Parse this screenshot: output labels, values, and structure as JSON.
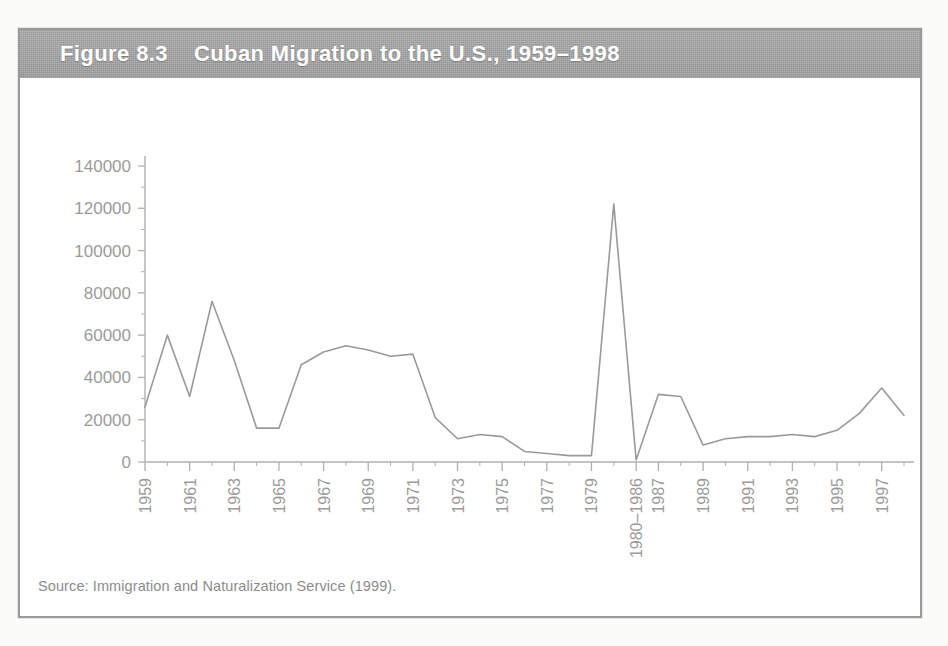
{
  "figure": {
    "number_label": "Figure 8.3",
    "title": "Cuban Migration to the U.S., 1959–1998",
    "source_note": "Source: Immigration and Naturalization Service (1999).",
    "banner_color": "#a3a3a3",
    "banner_text_color": "#ffffff",
    "line_color": "#9a9a9a",
    "axis_color": "#b0b0b0",
    "tick_label_color": "#9b9b9b",
    "frame_color": "#9a9a9a"
  },
  "chart_data": {
    "type": "line",
    "title": "Cuban Migration to the U.S., 1959–1998",
    "xlabel": "",
    "ylabel": "",
    "ylim": [
      0,
      140000
    ],
    "ytick_labels": [
      "0",
      "20000",
      "40000",
      "60000",
      "80000",
      "100000",
      "120000",
      "140000"
    ],
    "ytick_values": [
      0,
      20000,
      40000,
      60000,
      80000,
      100000,
      120000,
      140000
    ],
    "grid": false,
    "legend": "none",
    "xtick_labels_major": [
      "1959",
      "1961",
      "1963",
      "1965",
      "1967",
      "1969",
      "1971",
      "1973",
      "1975",
      "1977",
      "1979",
      "1980–1986",
      "1987",
      "1989",
      "1991",
      "1993",
      "1995",
      "1997"
    ],
    "categories": [
      "1959",
      "1960",
      "1961",
      "1962",
      "1963",
      "1964",
      "1965",
      "1966",
      "1967",
      "1968",
      "1969",
      "1970",
      "1971",
      "1972",
      "1973",
      "1974",
      "1975",
      "1976",
      "1977",
      "1978",
      "1979",
      "1980",
      "1980–1986",
      "1987",
      "1988",
      "1989",
      "1990",
      "1991",
      "1992",
      "1993",
      "1994",
      "1995",
      "1996",
      "1997",
      "1998"
    ],
    "values": [
      26000,
      60000,
      31000,
      76000,
      48000,
      16000,
      16000,
      46000,
      52000,
      55000,
      53000,
      50000,
      51000,
      21000,
      11000,
      13000,
      12000,
      5000,
      4000,
      3000,
      3000,
      122000,
      1000,
      32000,
      31000,
      8000,
      11000,
      12000,
      12000,
      13000,
      12000,
      15000,
      23000,
      35000,
      22000
    ],
    "annotations": [
      {
        "label": "Mariel boatlift peak",
        "x": "1980",
        "y": 122000
      }
    ]
  }
}
